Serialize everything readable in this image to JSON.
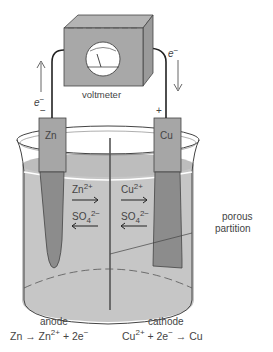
{
  "diagram": {
    "voltmeter": {
      "label": "voltmeter"
    },
    "electron_left": {
      "label": "e",
      "charge": "−",
      "direction": "up"
    },
    "electron_right": {
      "label": "e",
      "charge": "−",
      "direction": "down"
    },
    "terminal_left": "−",
    "terminal_right": "+",
    "electrodes": [
      {
        "label": "Zn",
        "role": "anode"
      },
      {
        "label": "Cu",
        "role": "cathode"
      }
    ],
    "ions_left": [
      {
        "ion": "Zn",
        "sup": "2+",
        "sub": "",
        "arrow": "→"
      },
      {
        "ion": "SO",
        "sup": "2−",
        "sub": "4",
        "arrow": "←"
      }
    ],
    "ions_right": [
      {
        "ion": "Cu",
        "sup": "2+",
        "sub": "",
        "arrow": "→"
      },
      {
        "ion": "SO",
        "sup": "2−",
        "sub": "4",
        "arrow": "←"
      }
    ],
    "partition_label_1": "porous",
    "partition_label_2": "partition",
    "anode": {
      "label": "anode",
      "eq_a": "Zn → Zn",
      "eq_sup": "2+",
      "eq_b": " + 2e",
      "eq_sup2": "−"
    },
    "cathode": {
      "label": "cathode",
      "eq_a": "Cu",
      "eq_sup": "2+",
      "eq_b": " + 2e",
      "eq_sup2": "−",
      "eq_c": " → Cu"
    },
    "colors": {
      "gray_box": "#a8a8a8",
      "solution": "#c4c4c4",
      "electrode_dark": "#8c8c8c",
      "line": "#333333"
    }
  }
}
